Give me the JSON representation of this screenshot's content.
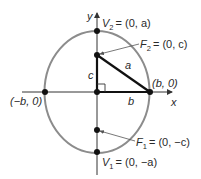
{
  "figure": {
    "colors": {
      "ellipse": "#8c8c8c",
      "axes": "#333333",
      "triangle": "#111111",
      "points": "#111111",
      "text": "#2a2a2a"
    },
    "axes": {
      "x_label": "x",
      "y_label": "y"
    },
    "points": {
      "v2": {
        "name": "V",
        "sub": "2",
        "coords": "= (0, a)"
      },
      "f2": {
        "name": "F",
        "sub": "2",
        "coords": "= (0, c)"
      },
      "f1": {
        "name": "F",
        "sub": "1",
        "coords": "= (0, −c)"
      },
      "v1": {
        "name": "V",
        "sub": "1",
        "coords": "= (0, −a)"
      },
      "right_vertex": "(b, 0)",
      "left_vertex": "(−b, 0)"
    },
    "triangle": {
      "side_c": "c",
      "side_a": "a",
      "side_b": "b"
    }
  }
}
